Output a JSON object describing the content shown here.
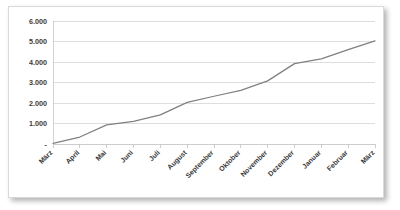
{
  "chart_data": {
    "type": "line",
    "title": "",
    "subtitle": "",
    "xlabel": "",
    "ylabel": "",
    "categories": [
      "März",
      "April",
      "Mai",
      "Juni",
      "Juli",
      "August",
      "September",
      "Oktober",
      "November",
      "Dezember",
      "Januar",
      "Februar",
      "März"
    ],
    "values": [
      30,
      340,
      930,
      1100,
      1420,
      2030,
      2330,
      2620,
      3080,
      3920,
      4150,
      4600,
      5030
    ],
    "series": [
      {
        "name": "",
        "values": [
          30,
          340,
          930,
          1100,
          1420,
          2030,
          2330,
          2620,
          3080,
          3920,
          4150,
          4600,
          5030
        ],
        "color": "#808080"
      }
    ],
    "ylim": [
      0,
      6000
    ],
    "ytick_values": [
      0,
      1000,
      2000,
      3000,
      4000,
      5000,
      6000
    ],
    "ytick_labels": [
      "-",
      "1.000",
      "2.000",
      "3.000",
      "4.000",
      "5.000",
      "6.000"
    ],
    "grid": true,
    "grid_axis": "y",
    "legend": false,
    "legend_position": "none",
    "markers": false,
    "xtick_label_rotation": "45",
    "annotations": []
  },
  "style": {
    "line_color": "#808080",
    "gridline_color": "#d0d0d0",
    "axis_color": "#c8c8c8",
    "text_color": "#3a3a3a",
    "panel_background": "#ffffff",
    "panel_border": "#d9d9d9"
  }
}
